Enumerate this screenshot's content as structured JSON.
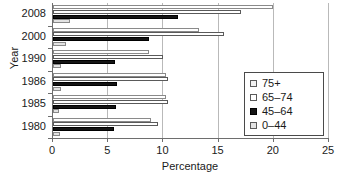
{
  "chart_data": {
    "type": "bar",
    "orientation": "horizontal",
    "title": "",
    "xlabel": "Percentage",
    "ylabel": "Year",
    "xlim": [
      0,
      25
    ],
    "xticks": [
      0,
      5,
      10,
      15,
      20,
      25
    ],
    "xticklabels": [
      "0",
      "5",
      "10",
      "15",
      "20",
      "25"
    ],
    "grid": true,
    "grid_axis": "x",
    "categories": [
      "2008",
      "2000",
      "1990",
      "1986",
      "1985",
      "1980"
    ],
    "legend_position": "right-inside",
    "series": [
      {
        "name": "75+",
        "color": "#ffffff",
        "edge_color": "#8a8a8a",
        "values": [
          19.9,
          13.2,
          8.7,
          10.2,
          10.2,
          8.9
        ]
      },
      {
        "name": "65–74",
        "color": "#ffffff",
        "edge_color": "#5a5a5a",
        "values": [
          17.0,
          15.5,
          10.0,
          10.4,
          10.4,
          9.5
        ]
      },
      {
        "name": "45–64",
        "color": "#141414",
        "edge_color": "#000000",
        "values": [
          11.3,
          8.7,
          5.6,
          5.8,
          5.7,
          5.5
        ]
      },
      {
        "name": "0–44",
        "color": "#e3e3e3",
        "edge_color": "#8a8a8a",
        "values": [
          1.5,
          1.2,
          0.7,
          0.7,
          0.5,
          0.6
        ]
      }
    ]
  }
}
